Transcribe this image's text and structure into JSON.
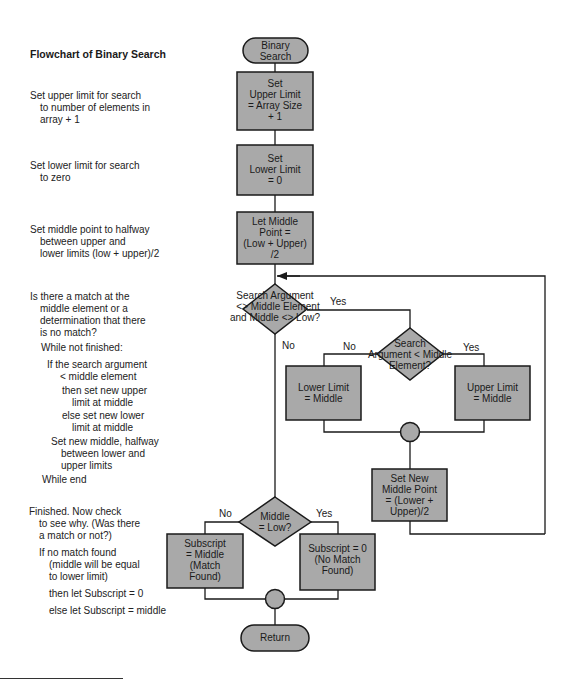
{
  "title": "Flowchart of Binary Search",
  "colors": {
    "shape_fill": "#a9a9a9",
    "stroke": "#1a1a1a",
    "background": "#ffffff"
  },
  "notes": [
    {
      "lines": [
        "Set upper limit for search",
        "to number of elements in",
        "array + 1"
      ]
    },
    {
      "lines": [
        "Set lower limit for search",
        "to zero"
      ]
    },
    {
      "lines": [
        "Set middle point to halfway",
        "between upper and",
        "lower limits (low + upper)/2"
      ]
    },
    {
      "lines": [
        "Is there a match at the",
        "middle element or a",
        "determination that there",
        "is no match?"
      ]
    },
    {
      "lines": [
        "While not finished:"
      ]
    },
    {
      "lines": [
        "If the search argument",
        "< middle element"
      ]
    },
    {
      "lines": [
        "then set new upper",
        "limit at middle"
      ]
    },
    {
      "lines": [
        "else set new lower",
        "limit at middle"
      ]
    },
    {
      "lines": [
        "Set new middle, halfway",
        "between lower and",
        "upper limits"
      ]
    },
    {
      "lines": [
        "While end"
      ]
    },
    {
      "lines": [
        "Finished. Now check",
        "to see why. (Was there",
        "a match or not?)"
      ]
    },
    {
      "lines": [
        "If no match found",
        "(middle will be equal",
        "to lower limit)"
      ]
    },
    {
      "lines": [
        "then let Subscript = 0"
      ]
    },
    {
      "lines": [
        "else let Subscript = middle"
      ]
    }
  ],
  "nodes": {
    "start": {
      "type": "terminator",
      "lines": [
        "Binary",
        "Search"
      ]
    },
    "set_upper": {
      "type": "process",
      "lines": [
        "Set",
        "Upper Limit",
        "= Array Size",
        "+ 1"
      ]
    },
    "set_lower": {
      "type": "process",
      "lines": [
        "Set",
        "Lower Limit",
        "= 0"
      ]
    },
    "let_middle": {
      "type": "process",
      "lines": [
        "Let Middle",
        "Point =",
        "(Low + Upper)",
        "/2"
      ]
    },
    "decision_match": {
      "type": "decision",
      "lines": [
        "Search Argument",
        "<> Middle Element",
        "and Middle <> Low?"
      ]
    },
    "decision_less": {
      "type": "decision",
      "lines": [
        "Search",
        "Argument < Middle",
        "Element?"
      ]
    },
    "lower_eq_middle": {
      "type": "process",
      "lines": [
        "Lower Limit",
        "= Middle"
      ]
    },
    "upper_eq_middle": {
      "type": "process",
      "lines": [
        "Upper Limit",
        "= Middle"
      ]
    },
    "set_new_middle": {
      "type": "process",
      "lines": [
        "Set New",
        "Middle Point",
        "= (Lower +",
        "Upper)/2"
      ]
    },
    "decision_low": {
      "type": "decision",
      "lines": [
        "Middle",
        "= Low?"
      ]
    },
    "subscript_middle": {
      "type": "process",
      "lines": [
        "Subscript",
        "= Middle",
        "(Match",
        "Found)"
      ]
    },
    "subscript_zero": {
      "type": "process",
      "lines": [
        "Subscript = 0",
        "(No Match",
        "Found)"
      ]
    },
    "return": {
      "type": "terminator",
      "lines": [
        "Return"
      ]
    }
  },
  "edges": {
    "match_yes": "Yes",
    "match_no": "No",
    "less_no": "No",
    "less_yes": "Yes",
    "low_no": "No",
    "low_yes": "Yes"
  }
}
